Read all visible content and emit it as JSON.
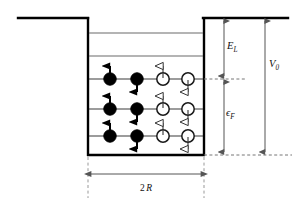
{
  "figure": {
    "type": "quantum-well-energy-diagram",
    "background": "#ffffff",
    "line_color": "#000000",
    "level_color": "#555555",
    "dash_color": "#777777"
  },
  "well": {
    "left_x": 88,
    "right_x": 204,
    "top_y": 18,
    "bottom_y": 155,
    "outer_left_x": 18,
    "outer_right_x": 288,
    "wall_thickness": 2.4
  },
  "levels": [
    {
      "id": "level-5",
      "y": 33,
      "occupied": false
    },
    {
      "id": "level-4",
      "y": 56,
      "occupied": false
    },
    {
      "id": "level-3",
      "y": 79,
      "occupied": true
    },
    {
      "id": "level-2",
      "y": 109,
      "occupied": true
    },
    {
      "id": "level-1",
      "y": 136,
      "occupied": true
    }
  ],
  "particles": {
    "columns": [
      {
        "id": "col-filled-up",
        "x": 110,
        "fill": "solid",
        "spin": "up"
      },
      {
        "id": "col-filled-down",
        "x": 137,
        "fill": "solid",
        "spin": "down"
      },
      {
        "id": "col-open-up",
        "x": 163,
        "fill": "open",
        "spin": "up"
      },
      {
        "id": "col-open-down",
        "x": 188,
        "fill": "open",
        "spin": "down"
      }
    ],
    "radius": 6.2,
    "arrow_len": 13
  },
  "annotations": {
    "e_l": {
      "label": "E",
      "subscript": "L",
      "x": 224,
      "top_y": 18,
      "bottom_y": 79,
      "label_x": 228,
      "label_y": 46
    },
    "eps_f": {
      "label": "ϵ",
      "subscript": "F",
      "x": 224,
      "top_y": 79,
      "bottom_y": 155,
      "label_x": 227,
      "label_y": 113
    },
    "v_0": {
      "label": "V",
      "subscript": "0",
      "x": 265,
      "top_y": 18,
      "bottom_y": 155,
      "label_x": 270,
      "label_y": 64
    },
    "two_r": {
      "label": "2",
      "italic": "R",
      "y": 174,
      "left_x": 88,
      "right_x": 204,
      "label_x": 146,
      "label_y": 189
    },
    "fermi_dash": {
      "x1": 204,
      "x2": 246,
      "y": 79
    },
    "bottom_dash": {
      "x1": 204,
      "x2": 290,
      "y": 155
    },
    "left_guide": {
      "x": 88,
      "y1": 157,
      "y2": 198
    },
    "right_guide": {
      "x": 204,
      "y1": 157,
      "y2": 198
    }
  }
}
